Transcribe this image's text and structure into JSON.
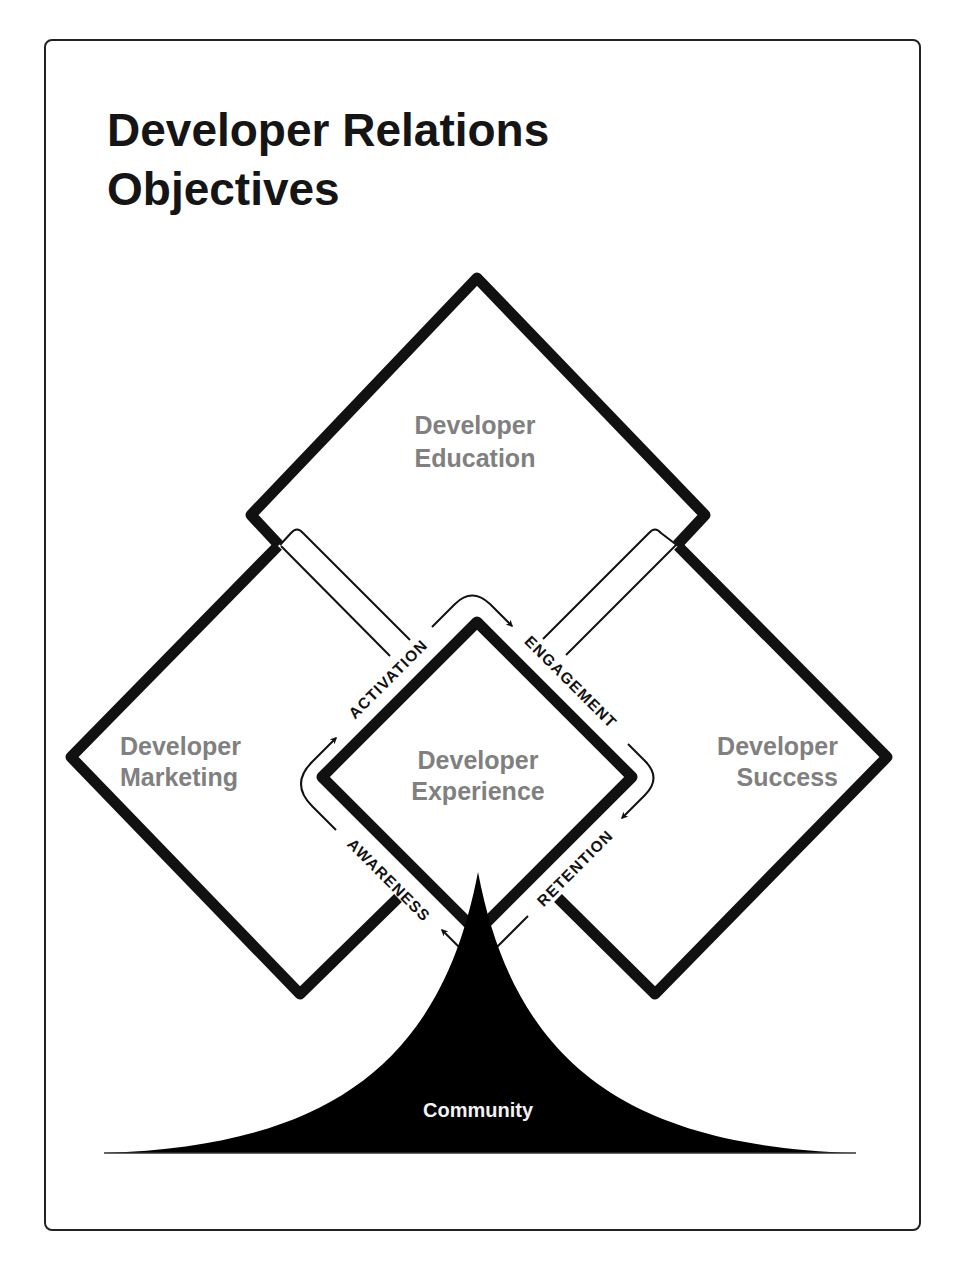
{
  "title": {
    "line1": "Developer Relations",
    "line2": "Objectives"
  },
  "areas": {
    "education": {
      "line1": "Developer",
      "line2": "Education"
    },
    "marketing": {
      "line1": "Developer",
      "line2": "Marketing"
    },
    "experience": {
      "line1": "Developer",
      "line2": "Experience"
    },
    "success": {
      "line1": "Developer",
      "line2": "Success"
    }
  },
  "stages": {
    "awareness": "AWARENESS",
    "activation": "ACTIVATION",
    "engagement": "ENGAGEMENT",
    "retention": "RETENTION"
  },
  "foundation": {
    "label": "Community"
  },
  "colors": {
    "background": "#ffffff",
    "stroke": "#111111",
    "area_label": "#808080",
    "community_fill": "#000000",
    "community_label": "#f2f2f2"
  }
}
